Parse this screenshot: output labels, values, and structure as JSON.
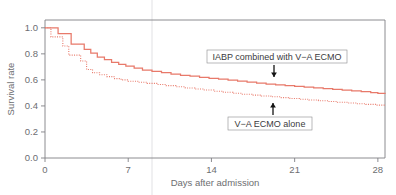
{
  "figure": {
    "kind": "kaplan-meier-survival-curve",
    "background_color": "#ffffff",
    "frame_color": "#808084",
    "fold_line_x": 152
  },
  "axes": {
    "x": {
      "label": "Days after admission",
      "ticks": [
        0,
        7,
        14,
        21,
        28
      ],
      "tick_labels": [
        "0",
        "7",
        "14",
        "21",
        "28"
      ],
      "range": [
        0,
        28.6
      ]
    },
    "y": {
      "label": "Survival rate",
      "ticks": [
        0.0,
        0.2,
        0.4,
        0.6,
        0.8,
        1.0
      ],
      "tick_labels": [
        "0.0",
        "0.2",
        "0.4",
        "0.6",
        "0.8",
        "1.0"
      ],
      "range": [
        0.0,
        1.06
      ]
    }
  },
  "annotations": [
    {
      "id": "iabp-ecmo",
      "text": "IABP combined with V−A ECMO",
      "arrow_direction": "down",
      "box_x": 207,
      "box_y": 50,
      "box_w": 140,
      "box_h": 13,
      "arrow_x": 274,
      "arrow_y1": 65,
      "arrow_y2": 77
    },
    {
      "id": "ecmo-alone",
      "text": "V−A ECMO alone",
      "arrow_direction": "up",
      "box_x": 228,
      "box_y": 117,
      "box_w": 84,
      "box_h": 13,
      "arrow_x": 273,
      "arrow_y1": 115,
      "arrow_y2": 103
    }
  ],
  "chart_data": {
    "type": "line",
    "title": "",
    "xlabel": "Days after admission",
    "ylabel": "Survival rate",
    "xlim": [
      0,
      28.6
    ],
    "ylim": [
      0.0,
      1.06
    ],
    "grid": false,
    "legend_position": "inline-annotation",
    "step_type": "post",
    "series": [
      {
        "name": "IABP combined with V−A ECMO",
        "color": "#e8796a",
        "style": "solid",
        "x": [
          0,
          0.55,
          1.1,
          1.65,
          2.2,
          2.75,
          3.3,
          3.85,
          4.4,
          5.0,
          5.6,
          6.2,
          6.8,
          7.5,
          8.2,
          9.0,
          9.8,
          10.6,
          11.4,
          12.2,
          13.0,
          13.8,
          14.6,
          15.4,
          16.2,
          17.0,
          17.8,
          18.6,
          19.4,
          20.2,
          21.0,
          21.8,
          22.6,
          23.4,
          24.2,
          25.0,
          25.8,
          26.6,
          27.4,
          28.0,
          28.6
        ],
        "y": [
          1.0,
          1.0,
          0.955,
          0.955,
          0.875,
          0.875,
          0.835,
          0.805,
          0.775,
          0.755,
          0.735,
          0.72,
          0.705,
          0.69,
          0.675,
          0.665,
          0.655,
          0.645,
          0.635,
          0.628,
          0.62,
          0.612,
          0.605,
          0.598,
          0.59,
          0.583,
          0.575,
          0.568,
          0.562,
          0.556,
          0.55,
          0.544,
          0.538,
          0.532,
          0.527,
          0.521,
          0.515,
          0.509,
          0.503,
          0.497,
          0.492
        ]
      },
      {
        "name": "V−A ECMO alone",
        "color": "#e8796a",
        "style": "dotted",
        "x": [
          0,
          0.5,
          1.0,
          1.5,
          2.0,
          2.5,
          3.0,
          3.5,
          4.0,
          4.6,
          5.2,
          5.8,
          6.4,
          7.0,
          7.8,
          8.6,
          9.4,
          10.2,
          11.0,
          11.8,
          12.6,
          13.4,
          14.2,
          15.0,
          15.8,
          16.6,
          17.4,
          18.2,
          19.0,
          19.8,
          20.6,
          21.4,
          22.2,
          23.0,
          23.8,
          24.6,
          25.4,
          26.2,
          27.0,
          27.8,
          28.6
        ],
        "y": [
          1.0,
          0.93,
          0.93,
          0.86,
          0.79,
          0.79,
          0.745,
          0.68,
          0.655,
          0.64,
          0.625,
          0.61,
          0.6,
          0.59,
          0.582,
          0.573,
          0.565,
          0.556,
          0.547,
          0.538,
          0.53,
          0.522,
          0.513,
          0.505,
          0.497,
          0.49,
          0.483,
          0.476,
          0.47,
          0.464,
          0.457,
          0.451,
          0.445,
          0.44,
          0.434,
          0.428,
          0.423,
          0.417,
          0.412,
          0.406,
          0.4
        ]
      }
    ]
  }
}
